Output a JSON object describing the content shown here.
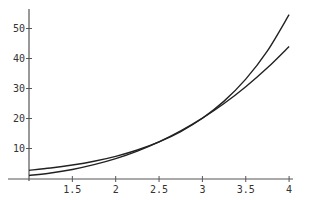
{
  "chart_data": {
    "type": "line",
    "title": "",
    "xlabel": "",
    "ylabel": "",
    "xlim": [
      1,
      4
    ],
    "ylim": [
      0,
      56
    ],
    "grid": false,
    "legend": null,
    "x_ticks": [
      1.5,
      2,
      2.5,
      3,
      3.5,
      4
    ],
    "x_tick_labels": [
      "1.5",
      "2",
      "2.5",
      "3",
      "3.5",
      "4"
    ],
    "y_ticks": [
      10,
      20,
      30,
      40,
      50
    ],
    "y_tick_labels": [
      "10",
      "20",
      "30",
      "40",
      "50"
    ],
    "x": [
      1,
      1.25,
      1.5,
      1.75,
      2,
      2.25,
      2.5,
      2.75,
      3,
      3.25,
      3.5,
      3.75,
      4
    ],
    "series": [
      {
        "name": "curve-upper-right",
        "values": [
          2.72,
          3.49,
          4.48,
          5.75,
          7.39,
          9.49,
          12.18,
          15.64,
          20.09,
          25.79,
          33.12,
          42.52,
          54.6
        ]
      },
      {
        "name": "curve-lower-right",
        "values": [
          1.0,
          1.84,
          3.02,
          4.61,
          6.63,
          9.15,
          12.21,
          15.85,
          20.1,
          25.0,
          30.6,
          36.9,
          44.0
        ]
      }
    ],
    "colors": {
      "line": "#222222",
      "axis": "#555555",
      "text": "#333333"
    }
  }
}
